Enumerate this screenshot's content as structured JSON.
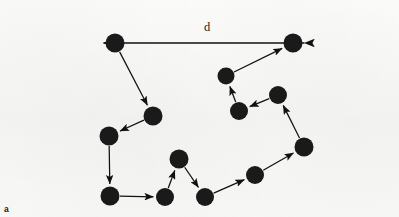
{
  "figure": {
    "panel_label": "a",
    "distance_label": "d",
    "background_color": "#f6f6f4",
    "node_color": "#1a1a1a",
    "edge_color": "#111111",
    "width": 399,
    "height": 217
  },
  "labels": {
    "panel": {
      "text": "a",
      "x": 4,
      "y": 205
    },
    "distance": {
      "text": "d",
      "x": 204,
      "y": 21
    }
  },
  "chart_data": {
    "type": "scatter",
    "title": "",
    "xlabel": "",
    "ylabel": "",
    "grid": false,
    "legend": "none",
    "xlim": [
      0,
      399
    ],
    "ylim": [
      0,
      217
    ],
    "node_radius": 9,
    "nodes": [
      {
        "id": "n1",
        "x": 115,
        "y": 43,
        "r": 9.5
      },
      {
        "id": "n2",
        "x": 293,
        "y": 43,
        "r": 9.5
      },
      {
        "id": "n3",
        "x": 226,
        "y": 76,
        "r": 8.5
      },
      {
        "id": "n4",
        "x": 239,
        "y": 111,
        "r": 9.0
      },
      {
        "id": "n5",
        "x": 278,
        "y": 95,
        "r": 9.0
      },
      {
        "id": "n6",
        "x": 304,
        "y": 147,
        "r": 9.5
      },
      {
        "id": "n7",
        "x": 255,
        "y": 175,
        "r": 9.0
      },
      {
        "id": "n8",
        "x": 205,
        "y": 197,
        "r": 9.0
      },
      {
        "id": "n9",
        "x": 179,
        "y": 159,
        "r": 9.5
      },
      {
        "id": "n10",
        "x": 165,
        "y": 197,
        "r": 9.0
      },
      {
        "id": "n11",
        "x": 110,
        "y": 196,
        "r": 9.5
      },
      {
        "id": "n12",
        "x": 109,
        "y": 136,
        "r": 9.5
      },
      {
        "id": "n13",
        "x": 153,
        "y": 116,
        "r": 9.5
      }
    ],
    "edges": [
      {
        "from": "n11",
        "to": "n10",
        "arrow": "forward"
      },
      {
        "from": "n10",
        "to": "n9",
        "arrow": "forward"
      },
      {
        "from": "n9",
        "to": "n8",
        "arrow": "forward"
      },
      {
        "from": "n8",
        "to": "n7",
        "arrow": "forward"
      },
      {
        "from": "n7",
        "to": "n6",
        "arrow": "forward"
      },
      {
        "from": "n6",
        "to": "n5",
        "arrow": "forward"
      },
      {
        "from": "n5",
        "to": "n4",
        "arrow": "forward"
      },
      {
        "from": "n4",
        "to": "n3",
        "arrow": "forward"
      },
      {
        "from": "n3",
        "to": "n2",
        "arrow": "forward"
      },
      {
        "from": "n1",
        "to": "n13",
        "arrow": "forward"
      },
      {
        "from": "n13",
        "to": "n12",
        "arrow": "forward"
      },
      {
        "from": "n12",
        "to": "n11",
        "arrow": "forward"
      }
    ],
    "measurement": {
      "label": "d",
      "from": {
        "x": 293,
        "y": 43
      },
      "to": {
        "x": 115,
        "y": 43
      },
      "arrow": "both"
    }
  }
}
